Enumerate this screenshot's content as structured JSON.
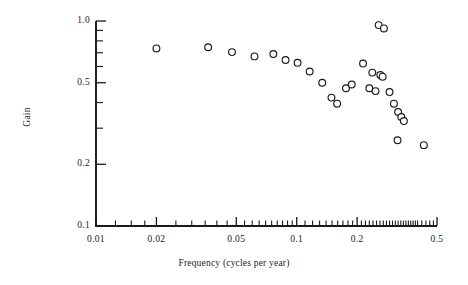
{
  "figure": {
    "background_color": "#ffffff",
    "ink_color": "#1a1a1a",
    "marker_color": "#1a1a1a",
    "marker_fill": "#ffffff"
  },
  "chart_data": {
    "type": "scatter",
    "title": "",
    "xlabel": "Frequency (cycles per year)",
    "ylabel": "Gain",
    "xscale": "log",
    "yscale": "log",
    "xlim": [
      0.01,
      0.5
    ],
    "ylim": [
      0.1,
      1.0
    ],
    "grid": false,
    "legend": "none",
    "marker": "open-circle",
    "xticks": [
      0.01,
      0.02,
      0.05,
      0.1,
      0.2,
      0.5
    ],
    "xtick_labels": [
      "0.01",
      "0.02",
      "0.05",
      "0.1",
      "0.2",
      "0.5"
    ],
    "x_minor_ticks": [
      0.0125,
      0.015,
      0.0175,
      0.025,
      0.03,
      0.035,
      0.04,
      0.045,
      0.055,
      0.06,
      0.065,
      0.07,
      0.075,
      0.08,
      0.085,
      0.09,
      0.095,
      0.11,
      0.12,
      0.13,
      0.14,
      0.15,
      0.16,
      0.17,
      0.18,
      0.19,
      0.21,
      0.22,
      0.23,
      0.24,
      0.25,
      0.26,
      0.27,
      0.28,
      0.29,
      0.3,
      0.31,
      0.32,
      0.33,
      0.34,
      0.35,
      0.36,
      0.37,
      0.38,
      0.39,
      0.4,
      0.42,
      0.44,
      0.46,
      0.48
    ],
    "yticks": [
      0.1,
      0.2,
      0.5,
      1.0
    ],
    "ytick_labels": [
      "0.1",
      "0.2",
      "0.5",
      "1.0"
    ],
    "y_minor_ticks": [
      0.3,
      0.4,
      0.6,
      0.7,
      0.8,
      0.9
    ],
    "points": [
      {
        "x": 0.02,
        "y": 0.735
      },
      {
        "x": 0.0362,
        "y": 0.745
      },
      {
        "x": 0.0476,
        "y": 0.705
      },
      {
        "x": 0.0616,
        "y": 0.672
      },
      {
        "x": 0.0765,
        "y": 0.69
      },
      {
        "x": 0.088,
        "y": 0.645
      },
      {
        "x": 0.101,
        "y": 0.625
      },
      {
        "x": 0.116,
        "y": 0.567
      },
      {
        "x": 0.134,
        "y": 0.5
      },
      {
        "x": 0.149,
        "y": 0.423
      },
      {
        "x": 0.159,
        "y": 0.395
      },
      {
        "x": 0.176,
        "y": 0.47
      },
      {
        "x": 0.188,
        "y": 0.49
      },
      {
        "x": 0.214,
        "y": 0.62
      },
      {
        "x": 0.256,
        "y": 0.955
      },
      {
        "x": 0.272,
        "y": 0.92
      },
      {
        "x": 0.238,
        "y": 0.56
      },
      {
        "x": 0.261,
        "y": 0.545
      },
      {
        "x": 0.268,
        "y": 0.535
      },
      {
        "x": 0.23,
        "y": 0.47
      },
      {
        "x": 0.247,
        "y": 0.455
      },
      {
        "x": 0.29,
        "y": 0.45
      },
      {
        "x": 0.305,
        "y": 0.395
      },
      {
        "x": 0.32,
        "y": 0.36
      },
      {
        "x": 0.332,
        "y": 0.34
      },
      {
        "x": 0.342,
        "y": 0.325
      },
      {
        "x": 0.318,
        "y": 0.262
      },
      {
        "x": 0.43,
        "y": 0.248
      }
    ]
  }
}
